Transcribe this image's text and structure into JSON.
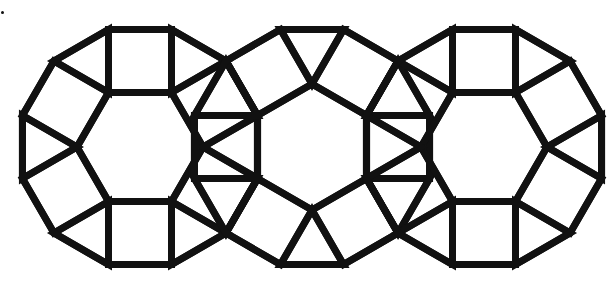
{
  "figure": {
    "type": "tessellation",
    "width": 613,
    "height": 285,
    "stroke_color": "#111111",
    "stroke_width": 7,
    "background": "#ffffff",
    "side": 63,
    "rosettes": [
      {
        "name": "left-rosette",
        "cx": 140,
        "cy": 147,
        "rotation_deg": 0
      },
      {
        "name": "middle-rosette",
        "cx": 312,
        "cy": 147,
        "rotation_deg": 30
      },
      {
        "name": "right-rosette",
        "cx": 484,
        "cy": 147,
        "rotation_deg": 0
      }
    ],
    "marker": {
      "name": "corner-dot",
      "x": 2,
      "y": 12
    }
  }
}
